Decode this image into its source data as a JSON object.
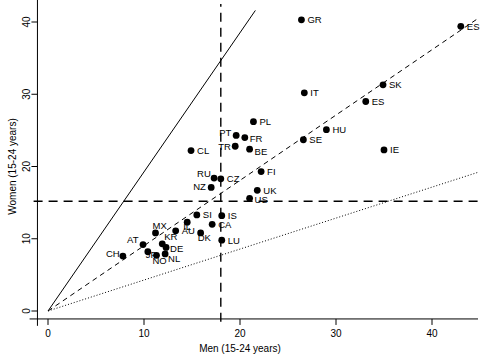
{
  "chart_data": {
    "type": "scatter",
    "title": "",
    "xlabel": "Men (15-24 years)",
    "ylabel": "Women (15-24 years)",
    "xlim": [
      -1.5,
      45
    ],
    "ylim": [
      -1.5,
      42.5
    ],
    "xticks": [
      0,
      10,
      20,
      30,
      40
    ],
    "yticks": [
      0,
      10,
      20,
      30,
      40
    ],
    "xtick_labels": [
      "0",
      "10",
      "20",
      "30",
      "40"
    ],
    "ytick_labels": [
      "0",
      "10",
      "20",
      "30",
      "40"
    ],
    "grid": false,
    "legend": "none",
    "point_label_field": "code",
    "points": [
      {
        "code": "GR",
        "x": 26.4,
        "y": 40.3,
        "label_dx": 6,
        "label_dy": 3.5
      },
      {
        "code": "ES",
        "x": 43.0,
        "y": 39.4,
        "label_dx": 6,
        "label_dy": 3.5
      },
      {
        "code": "SK",
        "x": 34.9,
        "y": 31.3,
        "label_dx": 6,
        "label_dy": 3.5
      },
      {
        "code": "IT",
        "x": 26.7,
        "y": 30.2,
        "label_dx": 6,
        "label_dy": 3.5
      },
      {
        "code": "ES",
        "x": 33.1,
        "y": 29.0,
        "label_dx": 6,
        "label_dy": 3.5
      },
      {
        "code": "HU",
        "x": 29.0,
        "y": 25.1,
        "label_dx": 6,
        "label_dy": 3.5
      },
      {
        "code": "SE",
        "x": 26.6,
        "y": 23.7,
        "label_dx": 6,
        "label_dy": 3.5
      },
      {
        "code": "PL",
        "x": 21.4,
        "y": 26.2,
        "label_dx": 6,
        "label_dy": 3.5
      },
      {
        "code": "PT",
        "x": 19.6,
        "y": 24.3,
        "label_dx": -17,
        "label_dy": 0.5
      },
      {
        "code": "FR",
        "x": 20.5,
        "y": 24.0,
        "label_dx": 5,
        "label_dy": 4
      },
      {
        "code": "TR",
        "x": 19.5,
        "y": 22.8,
        "label_dx": -17,
        "label_dy": 4
      },
      {
        "code": "BE",
        "x": 21.0,
        "y": 22.4,
        "label_dx": 5,
        "label_dy": 5.5
      },
      {
        "code": "IE",
        "x": 35.0,
        "y": 22.3,
        "label_dx": 6,
        "label_dy": 3.5
      },
      {
        "code": "CL",
        "x": 14.9,
        "y": 22.2,
        "label_dx": 6,
        "label_dy": 3.5
      },
      {
        "code": "FI",
        "x": 22.2,
        "y": 19.3,
        "label_dx": 6,
        "label_dy": 3.5
      },
      {
        "code": "CZ",
        "x": 18.0,
        "y": 18.3,
        "label_dx": 6,
        "label_dy": 3.5
      },
      {
        "code": "RU",
        "x": 17.3,
        "y": 18.4,
        "label_dx": -17,
        "label_dy": -0.6
      },
      {
        "code": "NZ",
        "x": 17.0,
        "y": 17.1,
        "label_dx": -18,
        "label_dy": 2.5
      },
      {
        "code": "UK",
        "x": 21.8,
        "y": 16.7,
        "label_dx": 6,
        "label_dy": 3.5
      },
      {
        "code": "US",
        "x": 21.0,
        "y": 15.6,
        "label_dx": 5,
        "label_dy": 5
      },
      {
        "code": "IS",
        "x": 18.1,
        "y": 13.2,
        "label_dx": 6,
        "label_dy": 3.5
      },
      {
        "code": "SI",
        "x": 15.5,
        "y": 13.3,
        "label_dx": 6,
        "label_dy": 3.5
      },
      {
        "code": "IL",
        "x": 14.5,
        "y": 12.3,
        "label_dx": -4,
        "label_dy": 8
      },
      {
        "code": "CA",
        "x": 17.1,
        "y": 12.0,
        "label_dx": 6,
        "label_dy": 3.5
      },
      {
        "code": "DK",
        "x": 15.9,
        "y": 10.8,
        "label_dx": -3,
        "label_dy": 8
      },
      {
        "code": "LU",
        "x": 18.1,
        "y": 9.8,
        "label_dx": 6,
        "label_dy": 3.5
      },
      {
        "code": "AU",
        "x": 13.3,
        "y": 11.1,
        "label_dx": 6,
        "label_dy": 3.5
      },
      {
        "code": "MX",
        "x": 11.2,
        "y": 10.8,
        "label_dx": -3,
        "label_dy": -3.5
      },
      {
        "code": "KR",
        "x": 11.9,
        "y": 9.3,
        "label_dx": 2,
        "label_dy": -3.5
      },
      {
        "code": "DE",
        "x": 12.3,
        "y": 8.8,
        "label_dx": 4,
        "label_dy": 4.5
      },
      {
        "code": "AT",
        "x": 9.9,
        "y": 9.2,
        "label_dx": -16,
        "label_dy": -2
      },
      {
        "code": "JP",
        "x": 10.4,
        "y": 8.2,
        "label_dx": -2,
        "label_dy": 6.5
      },
      {
        "code": "NO",
        "x": 11.3,
        "y": 7.7,
        "label_dx": -4,
        "label_dy": 9
      },
      {
        "code": "NL",
        "x": 12.2,
        "y": 7.9,
        "label_dx": 3,
        "label_dy": 8
      },
      {
        "code": "CH",
        "x": 7.8,
        "y": 7.6,
        "label_dx": -17,
        "label_dy": 1
      }
    ],
    "reference_lines": [
      {
        "name": "upper-bound-ray",
        "style": "solid",
        "from": [
          0,
          0
        ],
        "to": [
          21.6,
          41.6
        ]
      },
      {
        "name": "parity-ray",
        "style": "dashed",
        "from": [
          0,
          0
        ],
        "to": [
          44.8,
          40.5
        ]
      },
      {
        "name": "lower-bound-ray",
        "style": "dotted",
        "from": [
          0,
          0
        ],
        "to": [
          44.8,
          19.2
        ]
      }
    ],
    "guide_lines": [
      {
        "name": "vertical-guide",
        "orientation": "vertical",
        "value": 18.0
      },
      {
        "name": "horizontal-guide",
        "orientation": "horizontal",
        "value": 15.2
      }
    ]
  }
}
